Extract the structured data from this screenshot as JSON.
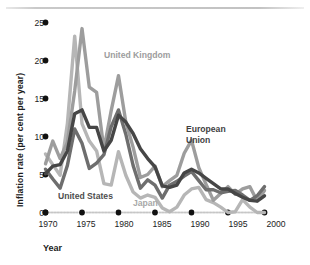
{
  "chart_data": {
    "type": "line",
    "title": "",
    "subtitle": "",
    "xlabel": "Year",
    "ylabel": "Inflation rate (per cent per year)",
    "xlim": [
      1970,
      2001
    ],
    "ylim": [
      0,
      26
    ],
    "xticks": [
      "1970",
      "1975",
      "1980",
      "1985",
      "1990",
      "1995",
      "2000"
    ],
    "xtick_values": [
      1970,
      1975,
      1980,
      1985,
      1990,
      1995,
      2000
    ],
    "yticks": [
      "0",
      "5",
      "10",
      "15",
      "20",
      "25"
    ],
    "ytick_values": [
      0,
      5,
      10,
      15,
      20,
      25
    ],
    "grid": false,
    "legend_position": "inline-annotations",
    "x": [
      1970,
      1971,
      1972,
      1973,
      1974,
      1975,
      1976,
      1977,
      1978,
      1979,
      1980,
      1981,
      1982,
      1983,
      1984,
      1985,
      1986,
      1987,
      1988,
      1989,
      1990,
      1991,
      1992,
      1993,
      1994,
      1995,
      1996,
      1997,
      1998,
      1999,
      2000
    ],
    "series": [
      {
        "name": "United Kingdom",
        "color": "#9d9d9d",
        "label_position": {
          "x": 104,
          "y": 50
        },
        "values": [
          6.4,
          9.4,
          7.1,
          9.2,
          16.0,
          24.2,
          16.5,
          15.8,
          8.3,
          13.4,
          18.0,
          11.9,
          8.6,
          4.6,
          5.0,
          6.1,
          3.4,
          4.2,
          4.9,
          7.8,
          9.5,
          5.9,
          3.7,
          1.6,
          2.5,
          3.4,
          2.4,
          3.1,
          3.4,
          1.5,
          2.9
        ]
      },
      {
        "name": "Japan",
        "color": "#b6b6b6",
        "label_position": {
          "x": 133,
          "y": 198
        },
        "values": [
          7.7,
          6.3,
          4.9,
          11.7,
          23.2,
          11.7,
          9.4,
          8.1,
          3.8,
          3.6,
          8.0,
          4.9,
          2.7,
          1.9,
          2.3,
          2.0,
          0.6,
          0.1,
          0.7,
          2.3,
          3.1,
          3.3,
          1.7,
          1.3,
          0.7,
          -0.1,
          0.1,
          1.7,
          0.7,
          -0.3,
          -0.7
        ]
      },
      {
        "name": "United States",
        "color": "#6e6e6e",
        "label_position": {
          "x": 58,
          "y": 191
        },
        "values": [
          5.7,
          4.4,
          3.2,
          6.2,
          11.0,
          9.1,
          5.8,
          6.5,
          7.6,
          11.3,
          13.5,
          10.3,
          6.2,
          3.2,
          4.3,
          3.6,
          1.9,
          3.6,
          4.1,
          4.8,
          5.4,
          4.2,
          3.0,
          3.0,
          2.6,
          2.8,
          2.9,
          2.3,
          1.6,
          2.2,
          3.4
        ]
      },
      {
        "name": "European Union",
        "color": "#464646",
        "label_position": {
          "x": 186,
          "y": 124
        },
        "values": [
          5.1,
          6.1,
          6.3,
          8.1,
          13.0,
          13.5,
          11.2,
          11.2,
          8.1,
          9.5,
          12.8,
          11.9,
          10.4,
          8.4,
          7.1,
          6.0,
          3.5,
          3.3,
          3.6,
          5.2,
          5.7,
          5.2,
          4.5,
          3.8,
          3.1,
          3.1,
          2.5,
          2.0,
          1.6,
          1.5,
          2.2
        ]
      }
    ],
    "annotations": [
      {
        "text": "United Kingdom",
        "color": "#9d9d9d"
      },
      {
        "text": "European Union",
        "color": "#3f3f3f"
      },
      {
        "text": "United States",
        "color": "#4e4e4e"
      },
      {
        "text": "Japan",
        "color": "#a8a8a8"
      }
    ]
  },
  "axes": {
    "y_title": "Inflation rate (per cent per year)",
    "x_title": "Year",
    "y_labels": [
      "25",
      "20",
      "15",
      "10",
      "5",
      "0"
    ],
    "x_labels": [
      "1970",
      "1975",
      "1980",
      "1985",
      "1990",
      "1995",
      "2000"
    ]
  },
  "labels": {
    "uk": "United Kingdom",
    "eu": "European\nUnion",
    "us": "United States",
    "jp": "Japan"
  }
}
